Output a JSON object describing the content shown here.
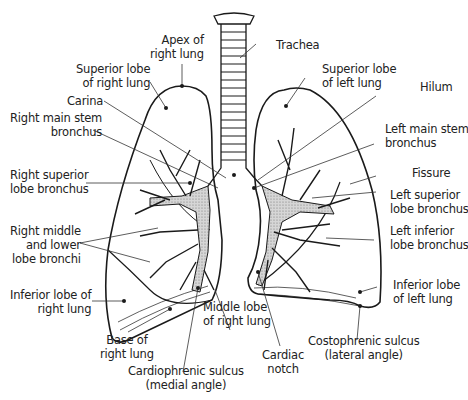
{
  "diagram": {
    "labels": {
      "apex_right": "Apex of\nright lung",
      "trachea": "Trachea",
      "superior_lobe_right": "Superior lobe\nof right lung",
      "superior_lobe_left": "Superior lobe\nof left lung",
      "hilum": "Hilum",
      "carina": "Carina",
      "right_main_stem": "Right main stem\nbronchus",
      "left_main_stem": "Left main stem\nbronchus",
      "fissure": "Fissure",
      "right_superior_lobe_bronchus": "Right superior\nlobe bronchus",
      "left_superior_lobe_bronchus": "Left superior\nlobe bronchus",
      "right_middle_lower": "Right middle\nand lower\nlobe bronchi",
      "left_inferior_lobe_bronchus": "Left inferior\nlobe bronchus",
      "inferior_lobe_right": "Inferior lobe of\nright lung",
      "inferior_lobe_left": "Inferior lobe\nof left lung",
      "middle_lobe_right": "Middle lobe\nof right lung",
      "base_right": "Base of\nright lung",
      "costophrenic": "Costophrenic sulcus\n(lateral angle)",
      "cardiac_notch": "Cardiac\nnotch",
      "cardiophrenic": "Cardiophrenic sulcus\n(medial angle)"
    },
    "colors": {
      "line": "#1a1a1a",
      "bronchi_fill": "#bdbdbd",
      "background": "#ffffff"
    }
  }
}
